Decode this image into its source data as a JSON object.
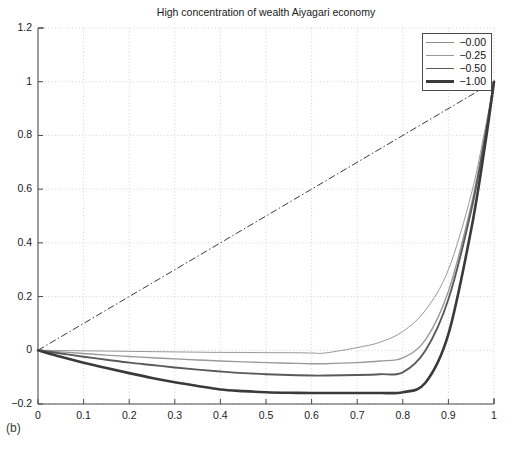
{
  "figure": {
    "panel_label": "(b)",
    "title": "High concentration of wealth Aiyagari economy"
  },
  "legend": {
    "position": "top-right",
    "entries": [
      {
        "label": "−0.00",
        "linewidth": 0.9,
        "color": "#8c8c8c"
      },
      {
        "label": "−0.25",
        "linewidth": 1.4,
        "color": "#9a9a9a"
      },
      {
        "label": "−0.50",
        "linewidth": 1.9,
        "color": "#5a5a5a"
      },
      {
        "label": "−1.00",
        "linewidth": 2.6,
        "color": "#3a3a3a"
      }
    ]
  },
  "axes": {
    "xlabel": "",
    "ylabel": "",
    "xlim": [
      0,
      1
    ],
    "ylim": [
      -0.2,
      1.2
    ],
    "grid": true,
    "xticks": [
      "0",
      "0.1",
      "0.2",
      "0.3",
      "0.4",
      "0.5",
      "0.6",
      "0.7",
      "0.8",
      "0.9",
      "1"
    ],
    "xtick_values": [
      0,
      0.1,
      0.2,
      0.3,
      0.4,
      0.5,
      0.6,
      0.7,
      0.8,
      0.9,
      1
    ],
    "yticks": [
      "1.2",
      "1",
      "0.8",
      "0.6",
      "0.4",
      "0.2",
      "0",
      "−0.2"
    ],
    "ytick_values": [
      1.2,
      1,
      0.8,
      0.6,
      0.4,
      0.2,
      0,
      -0.2
    ]
  },
  "chart_data": {
    "type": "line",
    "title": "High concentration of wealth Aiyagari economy",
    "xlabel": "",
    "ylabel": "",
    "xlim": [
      0,
      1
    ],
    "ylim": [
      -0.2,
      1.2
    ],
    "grid": true,
    "legend_position": "upper right",
    "x": [
      0,
      0.05,
      0.1,
      0.15,
      0.2,
      0.25,
      0.3,
      0.35,
      0.4,
      0.45,
      0.5,
      0.55,
      0.6,
      0.63,
      0.7,
      0.75,
      0.8,
      0.85,
      0.9,
      0.95,
      0.98,
      1
    ],
    "series": [
      {
        "name": "−0.00",
        "linewidth": 0.9,
        "color": "#8c8c8c",
        "values": [
          0,
          -0.001,
          -0.002,
          -0.003,
          -0.004,
          -0.005,
          -0.006,
          -0.007,
          -0.008,
          -0.008,
          -0.009,
          -0.009,
          -0.01,
          -0.01,
          0.01,
          0.03,
          0.07,
          0.15,
          0.3,
          0.58,
          0.82,
          1.0
        ]
      },
      {
        "name": "−0.25",
        "linewidth": 1.4,
        "color": "#9a9a9a",
        "values": [
          0,
          -0.006,
          -0.012,
          -0.018,
          -0.023,
          -0.028,
          -0.032,
          -0.036,
          -0.04,
          -0.043,
          -0.046,
          -0.048,
          -0.05,
          -0.05,
          -0.046,
          -0.04,
          -0.028,
          0.04,
          0.22,
          0.54,
          0.8,
          1.0
        ]
      },
      {
        "name": "−0.50",
        "linewidth": 1.9,
        "color": "#5a5a5a",
        "values": [
          0,
          -0.012,
          -0.024,
          -0.035,
          -0.046,
          -0.055,
          -0.064,
          -0.072,
          -0.079,
          -0.085,
          -0.089,
          -0.092,
          -0.094,
          -0.094,
          -0.092,
          -0.089,
          -0.082,
          0.0,
          0.19,
          0.52,
          0.79,
          1.0
        ]
      },
      {
        "name": "−1.00",
        "linewidth": 2.6,
        "color": "#3a3a3a",
        "values": [
          0,
          -0.024,
          -0.046,
          -0.066,
          -0.085,
          -0.103,
          -0.119,
          -0.133,
          -0.146,
          -0.152,
          -0.156,
          -0.158,
          -0.159,
          -0.159,
          -0.159,
          -0.159,
          -0.156,
          -0.12,
          0.06,
          0.45,
          0.76,
          1.0
        ]
      }
    ],
    "reference_line": {
      "name": "45-degree line",
      "style": "dash-dot",
      "color": "#3a3a3a",
      "linewidth": 1.0,
      "x": [
        0,
        1
      ],
      "values": [
        0,
        1
      ]
    },
    "annotations": [
      {
        "text": "(b)",
        "position": "below-axes-left"
      }
    ]
  }
}
